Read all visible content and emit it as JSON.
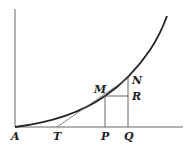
{
  "diagram": {
    "type": "geometry-figure",
    "colors": {
      "curve": "#222222",
      "axes": "#555555",
      "lines": "#666666",
      "background": "#ffffff"
    },
    "labels": {
      "A": "A",
      "T": "T",
      "P": "P",
      "Q": "Q",
      "M": "M",
      "N": "N",
      "R": "R"
    },
    "points": {
      "A": [
        15,
        127
      ],
      "T": [
        57,
        127
      ],
      "P": [
        105,
        127
      ],
      "Q": [
        128,
        127
      ],
      "M": [
        105,
        96
      ],
      "N": [
        128,
        78
      ],
      "R": [
        128,
        96
      ],
      "curve_end": [
        167,
        16
      ]
    }
  }
}
